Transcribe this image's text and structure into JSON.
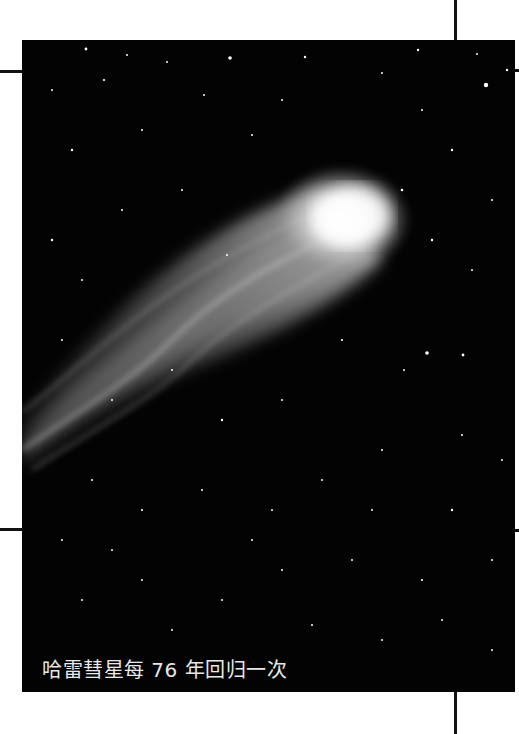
{
  "page": {
    "background": "#ffffff",
    "photo": {
      "subject": "Halley's Comet in starfield",
      "background_color": "#030303",
      "comet_head_color": "#f4f4f4",
      "tail_color": "#9a9a9a"
    },
    "caption": "哈雷彗星每 76 年回归一次",
    "trim_marks": {
      "color": "#111111"
    }
  }
}
